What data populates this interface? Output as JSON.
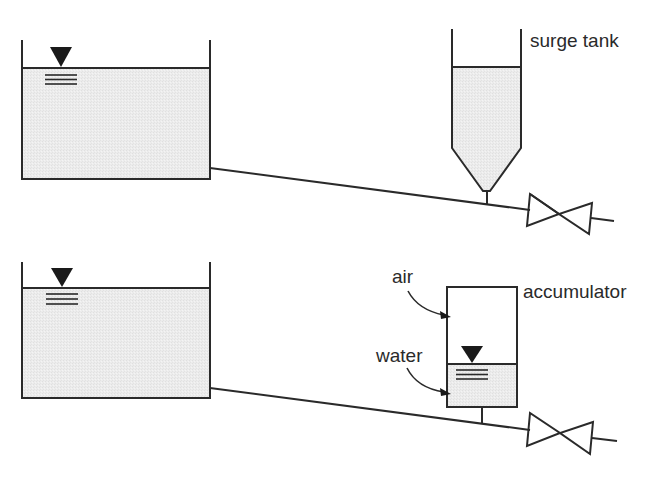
{
  "diagram": {
    "type": "hydraulic-schematic",
    "colors": {
      "line": "#2a2a2a",
      "water_fill": "#ebebeb",
      "marker": "#1a1a1a",
      "background": "#ffffff"
    },
    "top_system": {
      "reservoir": {
        "has_free_surface_marker": true
      },
      "device": {
        "kind": "surge tank",
        "label": "surge tank"
      },
      "valve": {
        "kind": "gate valve"
      }
    },
    "bottom_system": {
      "reservoir": {
        "has_free_surface_marker": true
      },
      "device": {
        "kind": "accumulator",
        "label": "accumulator",
        "callouts": [
          {
            "text": "air",
            "points_to": "upper chamber"
          },
          {
            "text": "water",
            "points_to": "lower chamber"
          }
        ]
      },
      "valve": {
        "kind": "gate valve"
      }
    }
  }
}
